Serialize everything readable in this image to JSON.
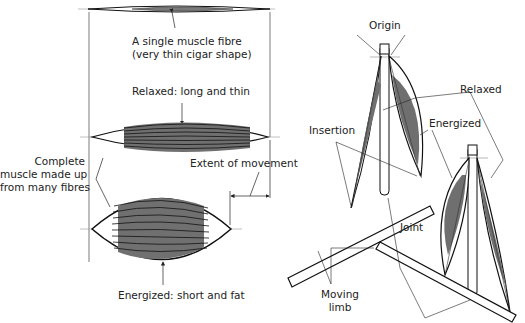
{
  "diagram": {
    "type": "muscle contraction illustration",
    "colors": {
      "muscle_fill": "#7a7a7a",
      "stroke": "#111111",
      "leader_line": "#333333",
      "background": "#ffffff"
    },
    "left_panel": {
      "labels": {
        "single_fibre_line1": "A single muscle fibre",
        "single_fibre_line2": "(very thin cigar shape)",
        "relaxed": "Relaxed: long and thin",
        "complete_line1": "Complete",
        "complete_line2": "muscle made up",
        "complete_line3": "from many fibres",
        "extent": "Extent of movement",
        "energized": "Energized: short and fat"
      }
    },
    "right_panel": {
      "labels": {
        "origin": "Origin",
        "relaxed": "Relaxed",
        "energized": "Energized",
        "insertion": "Insertion",
        "joint": "Joint",
        "moving_limb_line1": "Moving",
        "moving_limb_line2": "limb"
      }
    }
  }
}
